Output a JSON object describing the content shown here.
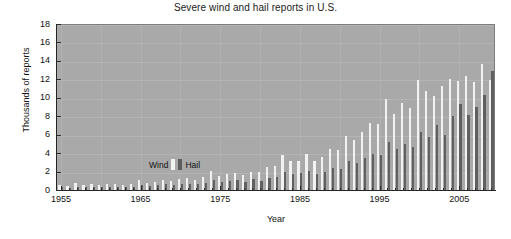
{
  "chart_data": {
    "type": "bar",
    "title": "Severe wind and hail reports in U.S.",
    "xlabel": "Year",
    "ylabel": "Thousands of reports",
    "ylim": [
      0,
      18
    ],
    "xlim": [
      1954.5,
      2009.5
    ],
    "ytick_labels": [
      "0",
      "2",
      "4",
      "6",
      "8",
      "10",
      "12",
      "14",
      "16",
      "18"
    ],
    "ytick_values": [
      0,
      2,
      4,
      6,
      8,
      10,
      12,
      14,
      16,
      18
    ],
    "xtick_labels": [
      "1955",
      "1965",
      "1975",
      "1985",
      "1995",
      "2005"
    ],
    "xtick_values": [
      1955,
      1965,
      1975,
      1985,
      1995,
      2005
    ],
    "grid": true,
    "legend_position": "inside-left",
    "plot_background": "#a9a9a9",
    "series": [
      {
        "name": "Wind",
        "color": "#f2f2f2",
        "values": [
          0.55,
          0.45,
          0.75,
          0.5,
          0.6,
          0.5,
          0.65,
          0.6,
          0.55,
          0.7,
          1.05,
          0.75,
          0.85,
          1.1,
          0.95,
          1.2,
          1.25,
          1.1,
          1.45,
          2.05,
          1.5,
          1.7,
          1.85,
          1.6,
          2.0,
          1.9,
          2.5,
          2.6,
          3.8,
          3.1,
          3.2,
          3.9,
          3.2,
          3.55,
          4.5,
          4.3,
          5.9,
          5.4,
          6.3,
          7.3,
          7.2,
          9.9,
          8.2,
          9.4,
          8.9,
          11.9,
          10.7,
          10.2,
          11.3,
          12.0,
          11.8,
          12.4,
          11.7,
          13.7,
          11.9,
          13.7,
          12.8,
          17.0
        ]
      },
      {
        "name": "Hail",
        "color": "#606060",
        "values": [
          0.3,
          0.25,
          0.35,
          0.3,
          0.32,
          0.28,
          0.3,
          0.3,
          0.3,
          0.35,
          0.5,
          0.45,
          0.5,
          0.6,
          0.55,
          0.65,
          0.7,
          0.6,
          0.8,
          1.1,
          0.85,
          0.95,
          1.05,
          0.9,
          1.15,
          1.0,
          1.3,
          1.4,
          2.0,
          1.7,
          1.8,
          2.1,
          1.75,
          1.9,
          2.4,
          2.3,
          3.1,
          2.9,
          3.5,
          3.9,
          3.8,
          5.2,
          4.4,
          5.0,
          4.7,
          6.3,
          5.7,
          7.1,
          6.0,
          8.0,
          9.3,
          8.1,
          9.0,
          10.3,
          12.9,
          16.6,
          12.2,
          17.5
        ]
      }
    ],
    "x_start_year": 1955,
    "x_end_year": 2012,
    "legend": [
      {
        "label": "Wind",
        "color": "#f2f2f2"
      },
      {
        "label": "Hail",
        "color": "#606060"
      }
    ]
  }
}
